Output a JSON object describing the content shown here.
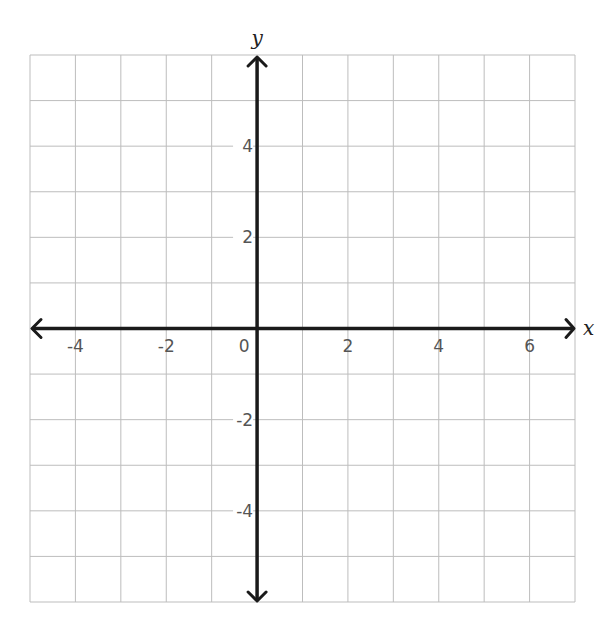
{
  "chart_data": {
    "type": "scatter",
    "title": "",
    "xlabel": "x",
    "ylabel": "y",
    "xlim": [
      -5,
      7
    ],
    "ylim": [
      -6,
      6
    ],
    "grid": true,
    "grid_step": 1,
    "x_ticks": [
      -4,
      -2,
      0,
      2,
      4,
      6
    ],
    "y_ticks": [
      4,
      2,
      -2,
      -4
    ],
    "origin_label": "0",
    "series": [],
    "axes_arrows": true
  },
  "layout": {
    "grid_left": 30,
    "grid_top": 55,
    "grid_right": 575,
    "grid_bottom": 602
  },
  "colors": {
    "grid": "#bdbdbd",
    "axis": "#1a1a1a",
    "tick_text": "#555555",
    "background": "#ffffff"
  }
}
